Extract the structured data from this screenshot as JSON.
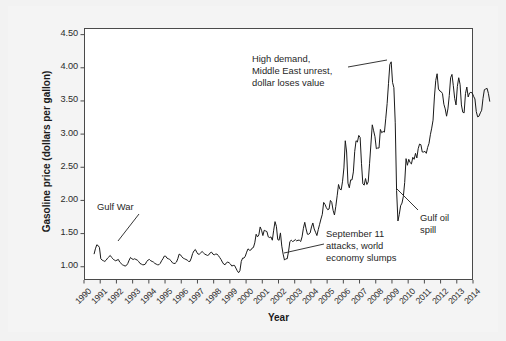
{
  "chart_data": {
    "type": "line",
    "title": "",
    "xlabel": "Year",
    "ylabel": "Gasoline price (dollars per gallon)",
    "xlim": [
      1990,
      2014
    ],
    "ylim": [
      0.8,
      4.6
    ],
    "yticks": [
      "1.00",
      "1.50",
      "2.00",
      "2.50",
      "3.00",
      "3.50",
      "4.00",
      "4.50"
    ],
    "ytick_values": [
      1.0,
      1.5,
      2.0,
      2.5,
      3.0,
      3.5,
      4.0,
      4.5
    ],
    "xticks": [
      "1990",
      "1991",
      "1992",
      "1993",
      "1994",
      "1995",
      "1996",
      "1997",
      "1998",
      "1999",
      "2000",
      "2001",
      "2002",
      "2003",
      "2004",
      "2005",
      "2006",
      "2007",
      "2008",
      "2009",
      "2010",
      "2011",
      "2012",
      "2013",
      "2014"
    ],
    "grid": false,
    "legend": "none",
    "line_color": "#1a1a1a",
    "series": [
      {
        "name": "Gasoline price (dollars per gallon)",
        "x_start": 1990.62,
        "x_step": 0.08333,
        "values": [
          1.19,
          1.27,
          1.33,
          1.32,
          1.29,
          1.12,
          1.1,
          1.09,
          1.08,
          1.1,
          1.13,
          1.15,
          1.17,
          1.14,
          1.12,
          1.1,
          1.09,
          1.1,
          1.11,
          1.07,
          1.05,
          1.03,
          1.02,
          1.01,
          1.02,
          1.05,
          1.1,
          1.14,
          1.12,
          1.11,
          1.12,
          1.11,
          1.1,
          1.08,
          1.05,
          1.04,
          1.03,
          1.03,
          1.04,
          1.08,
          1.1,
          1.11,
          1.09,
          1.08,
          1.07,
          1.05,
          1.04,
          1.03,
          1.03,
          1.05,
          1.09,
          1.12,
          1.16,
          1.16,
          1.13,
          1.12,
          1.11,
          1.09,
          1.06,
          1.05,
          1.05,
          1.07,
          1.12,
          1.19,
          1.18,
          1.15,
          1.13,
          1.12,
          1.11,
          1.1,
          1.08,
          1.08,
          1.13,
          1.2,
          1.24,
          1.26,
          1.22,
          1.19,
          1.19,
          1.21,
          1.23,
          1.21,
          1.19,
          1.18,
          1.17,
          1.18,
          1.21,
          1.22,
          1.19,
          1.18,
          1.19,
          1.19,
          1.17,
          1.14,
          1.11,
          1.07,
          1.04,
          1.03,
          1.06,
          1.07,
          1.06,
          1.04,
          1.01,
          1.02,
          1.02,
          0.98,
          0.94,
          0.91,
          0.94,
          1.08,
          1.13,
          1.13,
          1.16,
          1.22,
          1.27,
          1.25,
          1.25,
          1.28,
          1.29,
          1.36,
          1.49,
          1.45,
          1.48,
          1.6,
          1.55,
          1.47,
          1.55,
          1.54,
          1.53,
          1.45,
          1.44,
          1.45,
          1.4,
          1.55,
          1.68,
          1.61,
          1.41,
          1.4,
          1.51,
          1.31,
          1.19,
          1.1,
          1.12,
          1.12,
          1.23,
          1.38,
          1.4,
          1.38,
          1.39,
          1.41,
          1.39,
          1.4,
          1.4,
          1.38,
          1.45,
          1.58,
          1.67,
          1.57,
          1.49,
          1.49,
          1.51,
          1.6,
          1.66,
          1.57,
          1.52,
          1.47,
          1.56,
          1.64,
          1.72,
          1.79,
          1.97,
          1.94,
          1.89,
          1.86,
          1.87,
          2.0,
          1.97,
          1.85,
          1.78,
          1.91,
          2.07,
          2.24,
          2.17,
          2.16,
          2.29,
          2.49,
          2.9,
          2.73,
          2.26,
          2.19,
          2.31,
          2.31,
          2.43,
          2.74,
          2.9,
          2.88,
          2.98,
          2.95,
          2.56,
          2.25,
          2.23,
          2.33,
          2.24,
          2.28,
          2.56,
          2.85,
          3.14,
          3.05,
          2.96,
          2.78,
          2.79,
          2.79,
          3.07,
          3.02,
          3.04,
          3.03,
          3.24,
          3.46,
          3.76,
          4.05,
          4.09,
          3.78,
          3.7,
          3.17,
          2.15,
          1.69,
          1.79,
          1.92,
          1.96,
          2.06,
          2.27,
          2.63,
          2.53,
          2.62,
          2.57,
          2.55,
          2.65,
          2.62,
          2.71,
          2.64,
          2.78,
          2.85,
          2.84,
          2.73,
          2.73,
          2.74,
          2.71,
          2.8,
          2.86,
          2.99,
          3.09,
          3.21,
          3.56,
          3.81,
          3.91,
          3.68,
          3.65,
          3.64,
          3.61,
          3.45,
          3.38,
          3.27,
          3.38,
          3.58,
          3.85,
          3.9,
          3.73,
          3.54,
          3.44,
          3.72,
          3.85,
          3.75,
          3.44,
          3.33,
          3.32,
          3.61,
          3.71,
          3.56,
          3.62,
          3.63,
          3.62,
          3.57,
          3.53,
          3.34,
          3.26,
          3.27,
          3.32,
          3.36,
          3.54,
          3.67,
          3.68,
          3.69,
          3.61,
          3.49
        ]
      }
    ],
    "annotations": [
      {
        "name": "gulf-war",
        "lines": [
          "Gulf War"
        ],
        "text": "Gulf War",
        "leader_from": [
          131,
          208
        ],
        "leader_to": [
          110,
          235
        ]
      },
      {
        "name": "high-demand",
        "lines": [
          "High demand,",
          "Middle East unrest,",
          "dollar loses value"
        ],
        "text": "High demand,\nMiddle East unrest,\ndollar loses value",
        "leader_from": [
          340,
          61
        ],
        "leader_to": [
          379,
          54
        ]
      },
      {
        "name": "september-11",
        "lines": [
          "September 11",
          "attacks, world",
          "economy slumps"
        ],
        "text": "September 11\nattacks, world\neconomy slumps",
        "leader_from": [
          316,
          238
        ],
        "leader_to": [
          276,
          247
        ]
      },
      {
        "name": "gulf-oil-spill",
        "lines": [
          "Gulf oil",
          "spill"
        ],
        "text": "Gulf oil\nspill",
        "leader_from": [
          410,
          204
        ],
        "leader_to": [
          388,
          182
        ]
      }
    ]
  }
}
